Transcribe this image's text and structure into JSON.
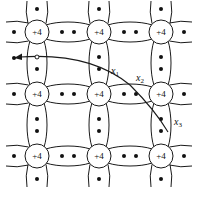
{
  "diagram": {
    "atom_label": "+4",
    "grid": {
      "xs": [
        37,
        99,
        161
      ],
      "ys": [
        32,
        94,
        156
      ]
    },
    "path_labels": {
      "x1": {
        "base": "x",
        "sub": "1"
      },
      "x2": {
        "base": "x",
        "sub": "2"
      },
      "x3": {
        "base": "x",
        "sub": "3"
      }
    },
    "colors": {
      "stroke": "#1a1a1a",
      "background": "#ffffff"
    }
  }
}
